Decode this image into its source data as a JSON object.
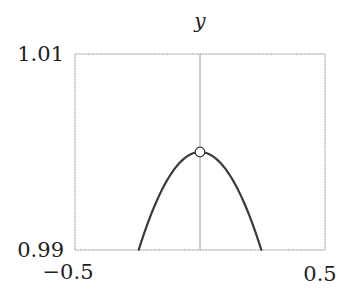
{
  "chart_data": {
    "type": "line",
    "title": "",
    "xlabel": "",
    "ylabel": "y",
    "xlim": [
      -0.5,
      0.5
    ],
    "ylim": [
      0.99,
      1.01
    ],
    "x_ticks": [
      "−0.5",
      "0.5"
    ],
    "y_ticks": [
      "1.01",
      "0.99"
    ],
    "grid": false,
    "legend": null,
    "series": [
      {
        "name": "y = sin(x)/x",
        "x": [
          -0.245,
          -0.2,
          -0.15,
          -0.1,
          -0.05,
          0.0,
          0.05,
          0.1,
          0.15,
          0.2,
          0.245
        ],
        "values": [
          0.99,
          0.99334,
          0.99625,
          0.99833,
          0.99958,
          1.0,
          0.99958,
          0.99833,
          0.99625,
          0.99334,
          0.99
        ]
      }
    ],
    "annotations": [
      {
        "type": "open-circle",
        "x": 0,
        "y": 1.0,
        "meaning": "removable discontinuity (hole) at x = 0"
      },
      {
        "type": "vertical-line",
        "x": 0
      }
    ],
    "colors": {
      "curve": "#3a3a3a",
      "frame": "#9a9a9a",
      "axis": "#9a9a9a"
    }
  },
  "labels": {
    "y_axis_title": "y",
    "y_top": "1.01",
    "y_bottom": "0.99",
    "x_left": "−0.5",
    "x_right": "0.5"
  }
}
